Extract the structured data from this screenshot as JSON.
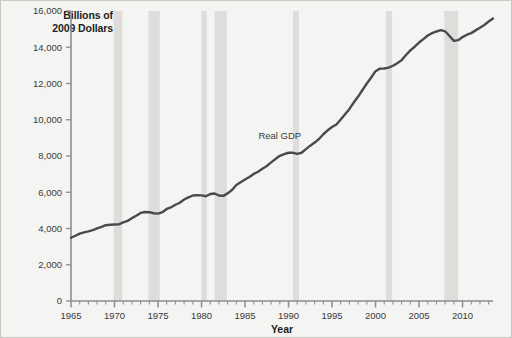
{
  "figure": {
    "background_color": "#f4f4f2",
    "border_color": "#c9c9c4"
  },
  "axis_titles": {
    "y_line1": "Billions of",
    "y_line2": "2009 Dollars",
    "x": "Year"
  },
  "series_annotation": {
    "label": "Real GDP"
  },
  "chart_data": {
    "type": "line",
    "title": "",
    "subtitle": "",
    "xlabel": "Year",
    "ylabel": "Billions of 2009 Dollars",
    "xlim": [
      1965,
      2013.5
    ],
    "ylim": [
      0,
      16000
    ],
    "grid": false,
    "legend_position": "inline-annotation",
    "line_color": "#4a4a4a",
    "line_width": 2.4,
    "x_major_ticks": [
      1965,
      1970,
      1975,
      1980,
      1985,
      1990,
      1995,
      2000,
      2005,
      2010
    ],
    "x_major_tick_labels": [
      "1965",
      "1970",
      "1975",
      "1980",
      "1985",
      "1990",
      "1995",
      "2000",
      "2005",
      "2010"
    ],
    "x_minor_tick_interval": 1,
    "y_ticks": [
      0,
      2000,
      4000,
      6000,
      8000,
      10000,
      12000,
      14000,
      16000
    ],
    "y_tick_labels": [
      "0",
      "2,000",
      "4,000",
      "6,000",
      "8,000",
      "10,000",
      "12,000",
      "14,000",
      "16,000"
    ],
    "annotations": [
      {
        "text": "Real GDP",
        "x": 1989.0,
        "y": 8950
      }
    ],
    "shaded_bands": {
      "color": "#dedddb",
      "label": "recessions",
      "ranges": [
        [
          1969.9,
          1970.9
        ],
        [
          1973.9,
          1975.2
        ],
        [
          1980.0,
          1980.6
        ],
        [
          1981.5,
          1982.9
        ],
        [
          1990.5,
          1991.2
        ],
        [
          2001.2,
          2001.9
        ],
        [
          2007.9,
          2009.5
        ]
      ]
    },
    "series": [
      {
        "name": "Real GDP",
        "x": [
          1965,
          1965.5,
          1966,
          1966.5,
          1967,
          1967.5,
          1968,
          1968.5,
          1969,
          1969.5,
          1970,
          1970.5,
          1971,
          1971.5,
          1972,
          1972.5,
          1973,
          1973.5,
          1974,
          1974.5,
          1975,
          1975.5,
          1976,
          1976.5,
          1977,
          1977.5,
          1978,
          1978.5,
          1979,
          1979.5,
          1980,
          1980.5,
          1981,
          1981.5,
          1982,
          1982.5,
          1983,
          1983.5,
          1984,
          1984.5,
          1985,
          1985.5,
          1986,
          1986.5,
          1987,
          1987.5,
          1988,
          1988.5,
          1989,
          1989.5,
          1990,
          1990.5,
          1991,
          1991.5,
          1992,
          1992.5,
          1993,
          1993.5,
          1994,
          1994.5,
          1995,
          1995.5,
          1996,
          1996.5,
          1997,
          1997.5,
          1998,
          1998.5,
          1999,
          1999.5,
          2000,
          2000.5,
          2001,
          2001.5,
          2002,
          2002.5,
          2003,
          2003.5,
          2004,
          2004.5,
          2005,
          2005.5,
          2006,
          2006.5,
          2007,
          2007.5,
          2008,
          2008.5,
          2009,
          2009.5,
          2010,
          2010.5,
          2011,
          2011.5,
          2012,
          2012.5,
          2013,
          2013.5
        ],
        "y": [
          3490,
          3600,
          3720,
          3790,
          3840,
          3910,
          4010,
          4090,
          4180,
          4210,
          4220,
          4230,
          4340,
          4420,
          4570,
          4700,
          4860,
          4910,
          4900,
          4840,
          4820,
          4900,
          5080,
          5170,
          5310,
          5420,
          5600,
          5720,
          5820,
          5840,
          5830,
          5780,
          5900,
          5930,
          5820,
          5800,
          5940,
          6120,
          6400,
          6550,
          6700,
          6840,
          7010,
          7130,
          7300,
          7450,
          7650,
          7830,
          8010,
          8100,
          8180,
          8180,
          8120,
          8180,
          8380,
          8570,
          8740,
          8940,
          9200,
          9420,
          9600,
          9740,
          10010,
          10300,
          10600,
          10950,
          11280,
          11640,
          12000,
          12330,
          12680,
          12820,
          12830,
          12880,
          12980,
          13120,
          13290,
          13570,
          13830,
          14030,
          14260,
          14450,
          14650,
          14780,
          14870,
          14940,
          14880,
          14620,
          14350,
          14390,
          14560,
          14690,
          14780,
          14930,
          15080,
          15230,
          15420,
          15580
        ]
      }
    ]
  }
}
